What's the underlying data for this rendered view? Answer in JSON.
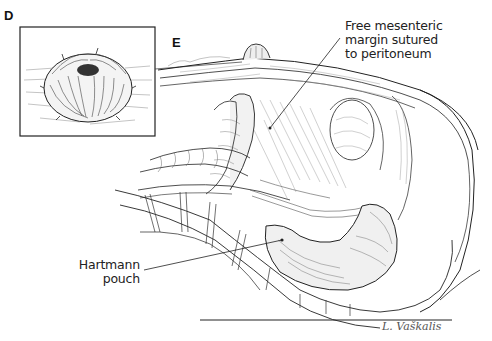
{
  "figure": {
    "panels": [
      {
        "id": "D",
        "letter": "D",
        "description": "Inset: everted end stoma viewed from above"
      },
      {
        "id": "E",
        "letter": "E",
        "description": "Sagittal view of abdomen/pelvis with end colostomy and closed rectal stump"
      }
    ],
    "labels": {
      "mesenteric": [
        "Free mesenteric",
        "margin sutured",
        "to peritoneum"
      ],
      "hartmann": [
        "Hartmann",
        "pouch"
      ]
    },
    "signature": "L. Vaškalis",
    "colors": {
      "ink": "#1a1a1a",
      "background": "#ffffff",
      "hatch": "#666666"
    }
  }
}
